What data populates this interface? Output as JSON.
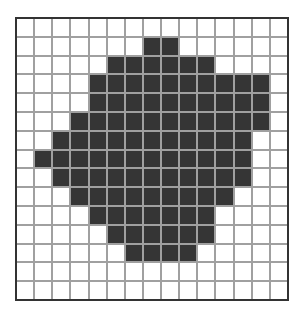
{
  "grid": {
    "rows": 15,
    "cols": 15,
    "colors": {
      "filled": "#353535",
      "empty": "#ffffff",
      "gridline": "#a0a0a0",
      "border": "#333333"
    },
    "filled_ranges": [
      [],
      [
        [
          7,
          8
        ]
      ],
      [
        [
          5,
          10
        ]
      ],
      [
        [
          4,
          13
        ]
      ],
      [
        [
          4,
          13
        ]
      ],
      [
        [
          3,
          13
        ]
      ],
      [
        [
          2,
          12
        ]
      ],
      [
        [
          1,
          12
        ]
      ],
      [
        [
          2,
          12
        ]
      ],
      [
        [
          3,
          11
        ]
      ],
      [
        [
          4,
          10
        ]
      ],
      [
        [
          5,
          10
        ]
      ],
      [
        [
          6,
          9
        ]
      ],
      [],
      []
    ]
  }
}
